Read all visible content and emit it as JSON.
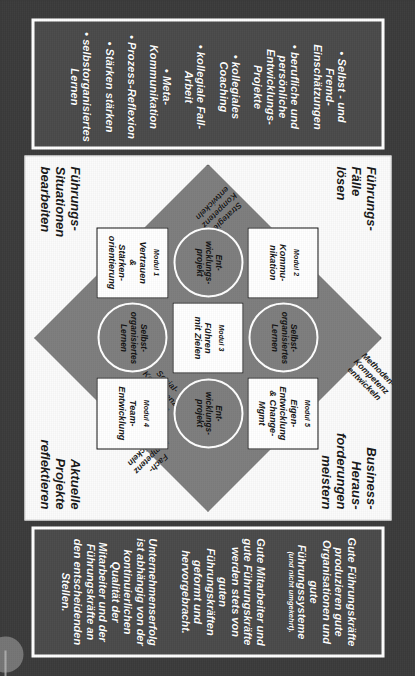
{
  "slide": {
    "orientation_degrees": 90,
    "background_color": "#3b3b3b",
    "panel_color": "#4a4a4a",
    "board_color": "#fbfbfb",
    "diamond_color": "#7d7d7d",
    "accent_color": "#ffffff"
  },
  "competencies_panel": {
    "items": [
      "• Selbst - und Fremd-\nEinschätzungen",
      "• berufliche und\npersönliche\nEntwicklungs-\nProjekte",
      "• kollegiales\nCoaching",
      "• kollegiale Fall-Arbeit",
      "• Meta-\nKommunikation",
      "• Prozess-Reflexion",
      "• Stärken stärken",
      "• selbstorganisiertes\nLernen"
    ]
  },
  "statements_panel": {
    "items": [
      {
        "text": "Gute Führungskräfte\nproduzieren gute\nOrganisationen und\ngute\nFührungssysteme",
        "sub": "(und nicht umgekehrt)."
      },
      {
        "text": "Gute Mitarbeiter und\ngute Führungskräfte\nwerden stets von\nguten\nFührungskräften\ngeformt und\nhervorgebracht.",
        "sub": ""
      },
      {
        "text": "Unternehmenserfolg\nist abhängig von der\nkontinuierlichen\nQualität der\nMitarbeiter und der\nFührungskräfte an\nden entscheidenden\nStellen.",
        "sub": ""
      }
    ]
  },
  "diagram": {
    "corner_captions": {
      "top_left": "Führungs-\nFälle\nlösen",
      "top_right": "Business-\nHeraus-\nforderungen\nmeistern",
      "bottom_left": "Führungs-\nSituationen\nbearbeiten",
      "bottom_right": "Aktuelle\nProjekte\nreflektieren"
    },
    "edge_labels": {
      "top_right_edge": "Methoden-\nKompetenz\nentwickeln",
      "bottom_right_edge": "Fach-\nKompetenz\nentwickeln",
      "bottom_left_edge": "Sozial-\nKompetenz\nentwickeln",
      "top_left_edge": "Strategie-\nKompetenz\nentwickeln"
    },
    "grid": {
      "r1c1": {
        "kind": "module",
        "num": "Modul 2",
        "title": "Kommu-\nnikation"
      },
      "r1c2": {
        "kind": "circle",
        "label": "Selbst-\norganisiertes\nLernen"
      },
      "r1c3": {
        "kind": "module",
        "num": "Modul 5",
        "title": "Eigen-\nEntwicklung\n& Change-\nMgmt"
      },
      "r2c1": {
        "kind": "circle",
        "label": "Ent-\nwicklungs-\nprojekt"
      },
      "r2c2": {
        "kind": "module",
        "num": "Modul 3",
        "title": "Führen\nmit Zielen"
      },
      "r2c3": {
        "kind": "circle",
        "label": "Ent-\nwicklungs-\nprojekt"
      },
      "r3c1": {
        "kind": "module",
        "num": "Modul 1",
        "title": "Vertrauen\n&\nStärken-\norientierung"
      },
      "r3c2": {
        "kind": "circle",
        "label": "Selbst-\norganisiertes\nLernen"
      },
      "r3c3": {
        "kind": "module",
        "num": "Modul 4",
        "title": "Team-\nEntwicklung"
      }
    }
  }
}
